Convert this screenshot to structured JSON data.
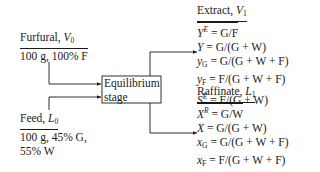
{
  "furfural": {
    "title": "Furfural, ",
    "symbol": "V",
    "symbol_sub": "0",
    "spec": "100 g, 100% F"
  },
  "feed": {
    "title": "Feed, ",
    "symbol": "L",
    "symbol_sub": "0",
    "spec_line1": "100 g, 45% G,",
    "spec_line2": "55% W"
  },
  "stage": {
    "line1": "Equilibrium",
    "line2": "stage"
  },
  "extract": {
    "title": "Extract, ",
    "symbol": "V",
    "symbol_sub": "1",
    "equations": [
      {
        "lhs": "Y",
        "lhs_sup": "E",
        "lhs_sub": "",
        "rhs": " = G/F"
      },
      {
        "lhs": "Y",
        "lhs_sup": "",
        "lhs_sub": "",
        "rhs": " = G/(G + W)"
      },
      {
        "lhs": "y",
        "lhs_sup": "",
        "lhs_sub": "G",
        "rhs": " = G/(G + W + F)"
      },
      {
        "lhs": "y",
        "lhs_sup": "",
        "lhs_sub": "F",
        "rhs": " = F/(G + W + F)"
      },
      {
        "lhs": "S",
        "lhs_sup": "E",
        "lhs_sub": "",
        "rhs": " = F/(G + W)"
      }
    ]
  },
  "raffinate": {
    "title": "Raffinate, ",
    "symbol": "L",
    "symbol_sub": "1",
    "equations": [
      {
        "lhs": "X",
        "lhs_sup": "R",
        "lhs_sub": "",
        "rhs": " = G/W"
      },
      {
        "lhs": "X",
        "lhs_sup": "",
        "lhs_sub": "",
        "rhs": " = G/(G + W)"
      },
      {
        "lhs": "x",
        "lhs_sup": "",
        "lhs_sub": "G",
        "rhs": " = G/(G + W + F)"
      },
      {
        "lhs": "x",
        "lhs_sup": "",
        "lhs_sub": "F",
        "rhs": " = F/(G + W + F)"
      },
      {
        "lhs": "S",
        "lhs_sup": "R",
        "lhs_sub": "",
        "rhs": " = F/(G + W)"
      }
    ]
  }
}
